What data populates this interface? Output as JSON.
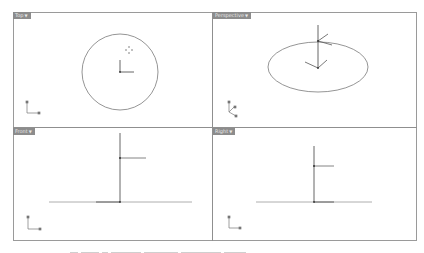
{
  "viewports": [
    {
      "id": "top",
      "label": "Top",
      "menu_icon": "triangle-down-icon"
    },
    {
      "id": "perspective",
      "label": "Perspective",
      "menu_icon": "triangle-down-icon"
    },
    {
      "id": "front",
      "label": "Front",
      "menu_icon": "triangle-down-icon"
    },
    {
      "id": "right",
      "label": "Right",
      "menu_icon": "triangle-down-icon"
    }
  ],
  "axes": {
    "top": {
      "x": "x",
      "y": "y"
    },
    "perspective": {
      "x": "x",
      "y": "y",
      "z": "z"
    },
    "front": {
      "x": "x",
      "y": "z"
    },
    "right": {
      "x": "y",
      "y": "z"
    }
  },
  "colors": {
    "frame": "#9a9a9a",
    "label_bg": "#8c8c8c",
    "geometry": "#555555",
    "ground": "#9a9a9a",
    "curve": "#7a7a7a"
  }
}
